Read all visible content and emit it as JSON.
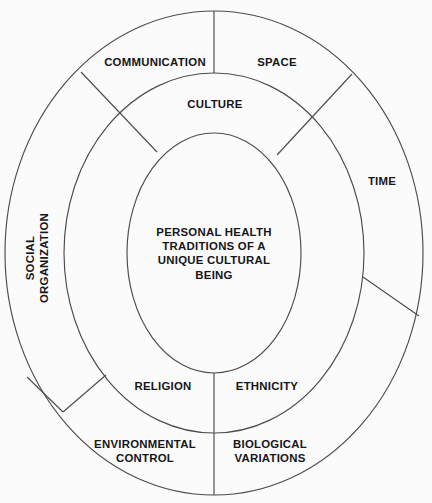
{
  "diagram": {
    "title": "Personal Health Traditions of a Unique Cultural Being",
    "type": "concentric-ellipse-model",
    "colors": {
      "background": "#fbfbfb",
      "stroke": "#4c4c52",
      "text": "#15151a"
    },
    "core": {
      "label": "PERSONAL HEALTH\nTRADITIONS OF A\nUNIQUE CULTURAL\nBEING"
    },
    "middle_ring": {
      "segments": [
        {
          "id": "culture",
          "label": "CULTURE"
        },
        {
          "id": "ethnicity",
          "label": "ETHNICITY"
        },
        {
          "id": "religion",
          "label": "RELIGION"
        }
      ]
    },
    "outer_ring": {
      "segments": [
        {
          "id": "communication",
          "label": "COMMUNICATION"
        },
        {
          "id": "space",
          "label": "SPACE"
        },
        {
          "id": "time",
          "label": "TIME"
        },
        {
          "id": "biological-variations",
          "label": "BIOLOGICAL\nVARIATIONS"
        },
        {
          "id": "environmental-control",
          "label": "ENVIRONMENTAL\nCONTROL"
        },
        {
          "id": "social-organization",
          "label": "SOCIAL\nORGANIZATION"
        }
      ]
    }
  }
}
